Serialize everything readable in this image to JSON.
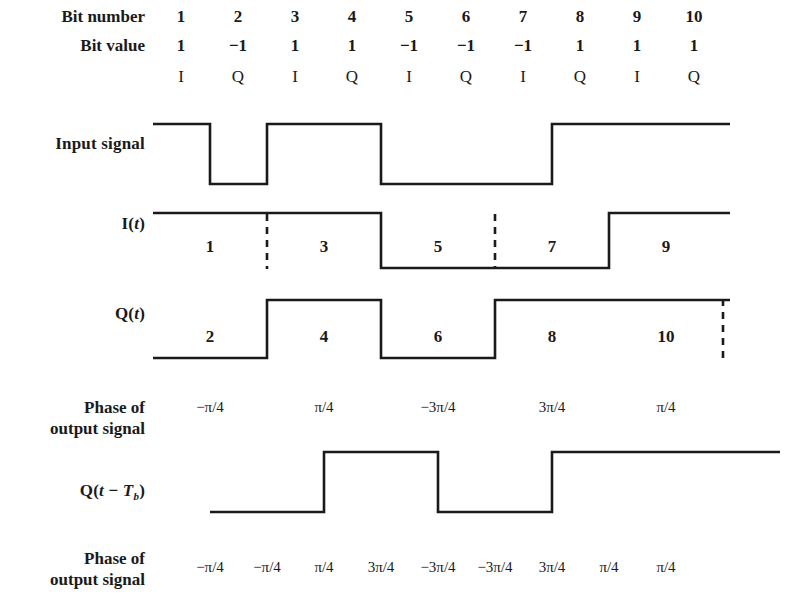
{
  "figure": {
    "line_color": "#1a1a1a",
    "background_color": "#ffffff"
  },
  "geometry": {
    "bit_x_start": 181,
    "bit_spacing": 57,
    "wave_left": 153,
    "wave_right": 730
  },
  "header": {
    "bit_number_label": "Bit number",
    "bit_value_label": "Bit value",
    "bit_numbers": [
      "1",
      "2",
      "3",
      "4",
      "5",
      "6",
      "7",
      "8",
      "9",
      "10"
    ],
    "bit_values": [
      "1",
      "−1",
      "1",
      "1",
      "−1",
      "−1",
      "−1",
      "1",
      "1",
      "1"
    ],
    "channels": [
      "I",
      "Q",
      "I",
      "Q",
      "I",
      "Q",
      "I",
      "Q",
      "I",
      "Q"
    ]
  },
  "rows": {
    "input_signal": {
      "label": "Input signal",
      "levels": [
        1,
        -1,
        1,
        1,
        -1,
        -1,
        -1,
        1,
        1,
        1
      ]
    },
    "i_signal": {
      "label_prefix": "I(",
      "label_var": "t",
      "label_suffix": ")",
      "segment_labels": [
        "1",
        "3",
        "5",
        "7",
        "9"
      ],
      "levels": [
        1,
        1,
        -1,
        -1,
        1
      ],
      "dashed_at_segments": [
        1,
        3
      ]
    },
    "q_signal": {
      "label_prefix": "Q(",
      "label_var": "t",
      "label_suffix": ")",
      "segment_labels": [
        "2",
        "4",
        "6",
        "8",
        "10"
      ],
      "levels": [
        -1,
        1,
        -1,
        1,
        1
      ],
      "dashed_at_segments": [
        4
      ]
    },
    "phase_row_1": {
      "label_line1": "Phase of",
      "label_line2": "output signal",
      "values": [
        "−π/4",
        "π/4",
        "−3π/4",
        "3π/4",
        "π/4"
      ]
    },
    "q_delayed": {
      "label_prefix": "Q(",
      "label_var": "t",
      "label_minus": " − ",
      "label_var2": "T",
      "label_sub": "b",
      "label_suffix": ")",
      "levels": [
        -1,
        1,
        -1,
        1,
        1
      ],
      "delay_bits": 1
    },
    "phase_row_2": {
      "label_line1": "Phase of",
      "label_line2": "output signal",
      "values": [
        "−π/4",
        "−π/4",
        "π/4",
        "3π/4",
        "−3π/4",
        "−3π/4",
        "3π/4",
        "π/4",
        "π/4"
      ]
    }
  }
}
